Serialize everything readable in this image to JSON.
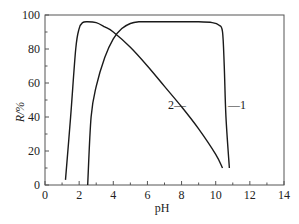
{
  "chart_data": {
    "type": "line",
    "title": "",
    "xlabel": "pH",
    "ylabel": "R/%",
    "xlim": [
      0,
      14
    ],
    "ylim": [
      0,
      100
    ],
    "xticks": [
      0,
      2,
      4,
      6,
      8,
      10,
      12,
      14
    ],
    "yticks": [
      0,
      20,
      40,
      60,
      80,
      100
    ],
    "grid": false,
    "legend": "inline labels",
    "series": [
      {
        "name": "1",
        "x": [
          2.5,
          2.7,
          3.0,
          3.5,
          4.0,
          4.5,
          5.0,
          5.5,
          6.0,
          7.0,
          8.0,
          9.0,
          9.8,
          10.2,
          10.4,
          10.5,
          10.6,
          10.8
        ],
        "y": [
          0,
          40,
          58,
          75,
          86,
          92,
          95,
          96,
          96,
          96,
          96,
          96,
          95.5,
          94,
          90,
          70,
          40,
          10
        ]
      },
      {
        "name": "2",
        "x": [
          1.2,
          1.5,
          1.8,
          2.0,
          2.2,
          2.5,
          3.0,
          3.5,
          4.0,
          5.0,
          6.0,
          7.0,
          8.0,
          9.0,
          10.0,
          10.4
        ],
        "y": [
          3,
          40,
          80,
          92,
          95.5,
          96,
          95.5,
          93,
          90,
          81,
          70,
          58,
          46,
          33,
          18,
          10
        ]
      }
    ],
    "annotations": [
      {
        "text": "1",
        "x": 10.8,
        "y": 48,
        "leader": "-1"
      },
      {
        "text": "2",
        "x": 7.2,
        "y": 48,
        "leader": "2-"
      }
    ]
  },
  "labels": {
    "ylabel": "R/%",
    "xlabel": "pH",
    "series1": "—1",
    "series2": "2—"
  }
}
